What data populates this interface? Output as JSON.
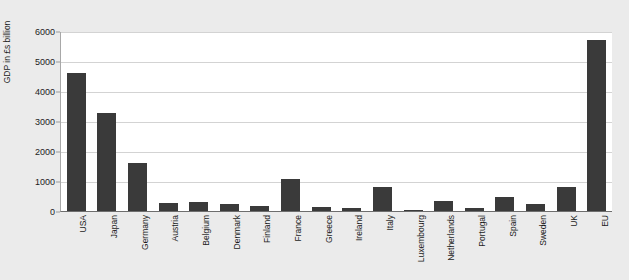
{
  "page": {
    "top_cut_text": "",
    "background_color": "#ebebeb",
    "plot_background_color": "#ffffff"
  },
  "chart_data": {
    "type": "bar",
    "title": "",
    "xlabel": "",
    "ylabel": "GDP in £s billion",
    "ylim": [
      0,
      6000
    ],
    "yticks": [
      0,
      1000,
      2000,
      3000,
      4000,
      5000,
      6000
    ],
    "ytick_labels": [
      "0",
      "1000",
      "2000",
      "3000",
      "4000",
      "5000",
      "6000"
    ],
    "grid": true,
    "legend": null,
    "bar_color": "#3a3a3a",
    "categories": [
      "USA",
      "Japan",
      "Germany",
      "Austria",
      "Belgium",
      "Denmark",
      "Finland",
      "France",
      "Greece",
      "Ireland",
      "Italy",
      "Luxembourg",
      "Netherlands",
      "Portugal",
      "Spain",
      "Sweden",
      "UK",
      "EU"
    ],
    "values": [
      4600,
      3280,
      1600,
      260,
      300,
      220,
      160,
      1080,
      130,
      90,
      800,
      20,
      330,
      110,
      470,
      230,
      800,
      5700
    ]
  }
}
